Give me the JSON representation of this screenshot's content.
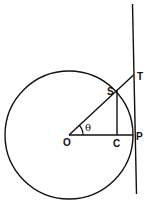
{
  "diagram": {
    "type": "unit-circle-trig",
    "labels": {
      "O": "O",
      "C": "C",
      "P": "P",
      "S": "S",
      "T": "T",
      "angle": "θ"
    },
    "colors": {
      "stroke": "#111111",
      "background": "#ffffff"
    }
  }
}
